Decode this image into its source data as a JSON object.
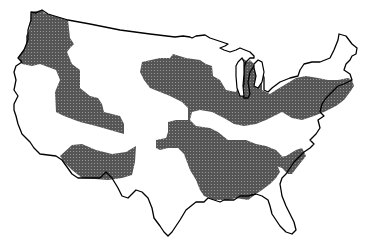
{
  "map": {
    "title": "Contiguous United States shaded regions",
    "region": "Contiguous United States",
    "style": "black-and-white outline map with dotted-stipple shaded regions",
    "colors": {
      "background": "#ffffff",
      "outline": "#000000",
      "shade": "#5a5a5a",
      "shade_dot": "#9a9a9a"
    },
    "shaded_regions": [
      {
        "name": "pacific-northwest-intermountain"
      },
      {
        "name": "southwest-arizona"
      },
      {
        "name": "northern-plains-midwest"
      },
      {
        "name": "great-lakes-northeast"
      },
      {
        "name": "south-central"
      },
      {
        "name": "carolinas"
      }
    ]
  }
}
